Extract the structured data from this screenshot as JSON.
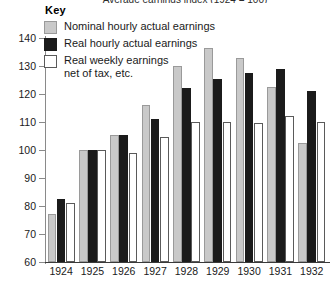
{
  "chart_data": {
    "type": "bar",
    "title": "Average earnings index (1924 = 100)",
    "xlabel": "",
    "ylabel": "",
    "ylim": [
      60,
      140
    ],
    "ystep": 10,
    "yticks": [
      60,
      70,
      80,
      90,
      100,
      110,
      120,
      130,
      140
    ],
    "grid": false,
    "legend_position": "top-left",
    "legend_title": "Key",
    "categories": [
      "1924",
      "1925",
      "1926",
      "1927",
      "1928",
      "1929",
      "1930",
      "1931",
      "1932"
    ],
    "series": [
      {
        "name": "Nominal hourly actual earnings",
        "color": "#c9c9c9",
        "values": [
          77,
          100,
          105.5,
          116,
          130,
          136.5,
          133,
          122.5,
          102.5
        ]
      },
      {
        "name": "Real hourly actual earnings",
        "color": "#1b1b1b",
        "values": [
          82.5,
          100,
          105.5,
          111,
          122,
          125.5,
          127.5,
          129,
          121
        ]
      },
      {
        "name": "Real weekly earnings net of tax, etc.",
        "color": "#ffffff",
        "values": [
          81,
          100,
          99,
          104.5,
          110,
          110,
          109.5,
          112,
          110
        ]
      }
    ]
  },
  "legend": {
    "title": "Key",
    "items": [
      {
        "swatch": "nominal",
        "line1": "Nominal hourly actual earnings",
        "line2": ""
      },
      {
        "swatch": "real",
        "line1": "Real hourly actual earnings",
        "line2": ""
      },
      {
        "swatch": "weekly",
        "line1": "Real weekly earnings",
        "line2": "net of tax, etc."
      }
    ]
  }
}
